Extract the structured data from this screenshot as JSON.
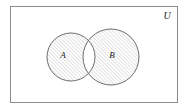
{
  "figure": {
    "kind": "venn-diagram",
    "caption": "",
    "background_color": "#fefefe"
  },
  "universe": {
    "label": "U",
    "label_x": 167,
    "label_y": 17,
    "rect": {
      "x": 10,
      "y": 6,
      "width": 168,
      "height": 97
    },
    "border_color": "#8c8c8c",
    "border_width": 1,
    "fill_color": "#ffffff",
    "shaded": false
  },
  "sets": [
    {
      "label": "A",
      "name": "set-a",
      "cx": 71,
      "cy": 57,
      "r": 24,
      "label_x": 63,
      "label_y": 56,
      "shaded": true,
      "stroke_color": "#6e6e6e",
      "stroke_width": 1,
      "fill_color": "#f2f2f2"
    },
    {
      "label": "B",
      "name": "set-b",
      "cx": 111,
      "cy": 57,
      "r": 28,
      "label_x": 112,
      "label_y": 56,
      "shaded": true,
      "stroke_color": "#6e6e6e",
      "stroke_width": 1,
      "fill_color": "#f2f2f2"
    }
  ],
  "intersection": {
    "name": "intersection-region",
    "label": "",
    "shaded": false,
    "fill_color": "#ffffff",
    "description": "unshaded lens where A and B overlap"
  },
  "hatching": {
    "style": "diagonal-lines",
    "direction": "lower-left to upper-right",
    "angle_degrees": 45,
    "spacing_px": 2.6,
    "line_color": "#9a9a9a",
    "line_width": 0.55
  },
  "colors": {
    "ink": "#1a1a1a",
    "outline": "#6e6e6e",
    "frame": "#8c8c8c",
    "hatch": "#9a9a9a",
    "paper": "#fefefe"
  }
}
